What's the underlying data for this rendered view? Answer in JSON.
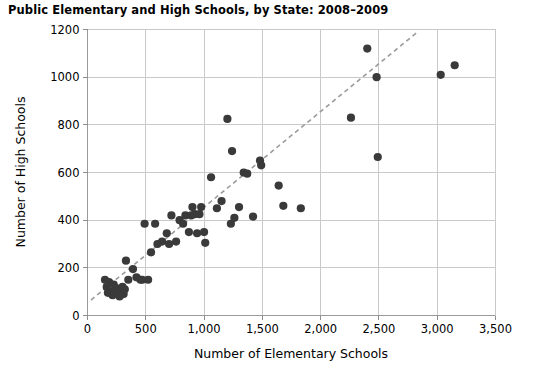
{
  "chart_data": {
    "type": "scatter",
    "title": "Public Elementary and High Schools, by State: 2008–2009",
    "xlabel": "Number of Elementary Schools",
    "ylabel": "Number of High Schools",
    "xlim": [
      0,
      3500
    ],
    "ylim": [
      0,
      1200
    ],
    "xticks": [
      0,
      500,
      1000,
      1500,
      2000,
      2500,
      3000,
      3500
    ],
    "xtick_labels": [
      "0",
      "500",
      "1,000",
      "1,500",
      "2,000",
      "2,500",
      "3,000",
      "3,500"
    ],
    "yticks": [
      0,
      200,
      400,
      600,
      800,
      1000,
      1200
    ],
    "ytick_labels": [
      "0",
      "200",
      "400",
      "600",
      "800",
      "1000",
      "1200"
    ],
    "grid": true,
    "legend": false,
    "marker_color": "#3a3a3a",
    "marker_size": 6,
    "trendline": {
      "style": "dashed",
      "color": "#9b9b9b",
      "x": [
        30,
        2820
      ],
      "y": [
        65,
        1185
      ]
    },
    "points": [
      [
        150,
        150
      ],
      [
        165,
        120
      ],
      [
        175,
        95
      ],
      [
        185,
        140
      ],
      [
        200,
        100
      ],
      [
        215,
        85
      ],
      [
        225,
        130
      ],
      [
        245,
        115
      ],
      [
        250,
        95
      ],
      [
        265,
        105
      ],
      [
        275,
        80
      ],
      [
        285,
        100
      ],
      [
        300,
        120
      ],
      [
        310,
        90
      ],
      [
        320,
        110
      ],
      [
        330,
        230
      ],
      [
        350,
        150
      ],
      [
        390,
        195
      ],
      [
        420,
        160
      ],
      [
        455,
        150
      ],
      [
        470,
        150
      ],
      [
        490,
        385
      ],
      [
        520,
        150
      ],
      [
        545,
        265
      ],
      [
        580,
        385
      ],
      [
        600,
        300
      ],
      [
        640,
        310
      ],
      [
        680,
        345
      ],
      [
        700,
        300
      ],
      [
        720,
        420
      ],
      [
        760,
        310
      ],
      [
        790,
        400
      ],
      [
        820,
        385
      ],
      [
        840,
        420
      ],
      [
        870,
        350
      ],
      [
        890,
        420
      ],
      [
        900,
        455
      ],
      [
        920,
        425
      ],
      [
        940,
        345
      ],
      [
        960,
        425
      ],
      [
        975,
        455
      ],
      [
        1000,
        350
      ],
      [
        1010,
        305
      ],
      [
        1060,
        580
      ],
      [
        1110,
        450
      ],
      [
        1150,
        480
      ],
      [
        1200,
        825
      ],
      [
        1230,
        385
      ],
      [
        1240,
        690
      ],
      [
        1260,
        410
      ],
      [
        1300,
        455
      ],
      [
        1340,
        600
      ],
      [
        1370,
        595
      ],
      [
        1420,
        415
      ],
      [
        1480,
        650
      ],
      [
        1490,
        630
      ],
      [
        1640,
        545
      ],
      [
        1680,
        460
      ],
      [
        1830,
        450
      ],
      [
        2260,
        830
      ],
      [
        2400,
        1120
      ],
      [
        2480,
        1000
      ],
      [
        2490,
        665
      ],
      [
        3030,
        1010
      ],
      [
        3150,
        1050
      ]
    ]
  }
}
